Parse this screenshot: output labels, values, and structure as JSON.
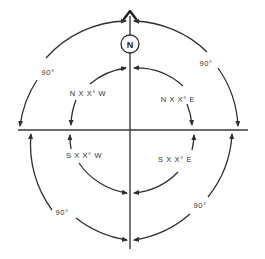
{
  "diagram": {
    "north_label": "N",
    "quadrants": {
      "ne": "N X X° E",
      "nw": "N X X° W",
      "se": "S X X° E",
      "sw": "S X X° W"
    },
    "outer_angles": {
      "ne": "90°",
      "nw": "90°",
      "se": "90°",
      "sw": "90°"
    },
    "colors": {
      "line": "#3a3a3a",
      "text": "#333333",
      "background": "#ffffff"
    }
  }
}
